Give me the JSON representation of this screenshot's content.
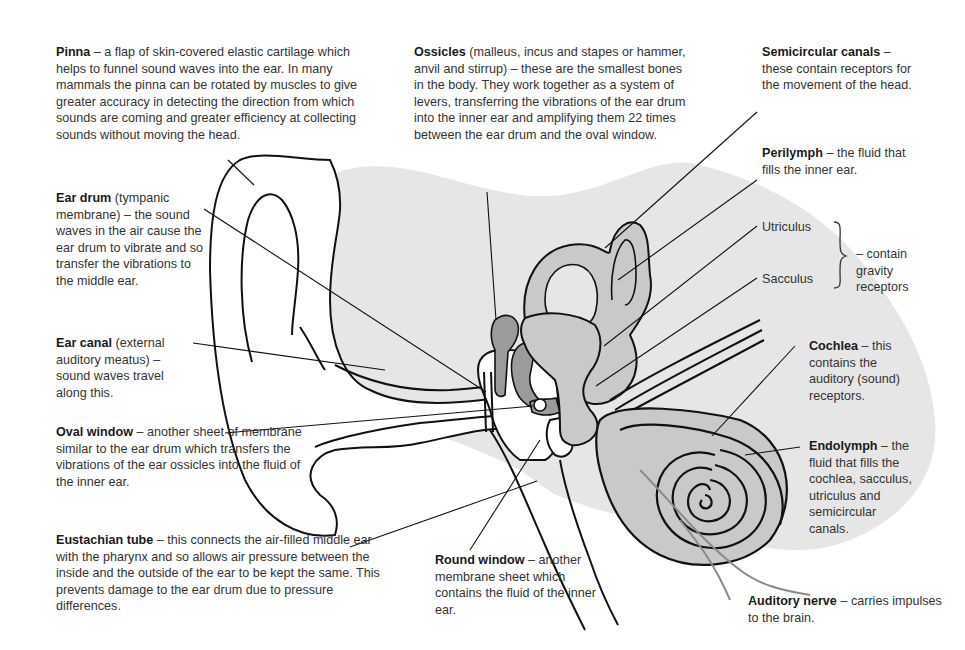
{
  "diagram": {
    "colors": {
      "head_shading": "#e6e6e6",
      "inner_fill": "#c9c9c9",
      "ossicle_fill": "#9b9b9b",
      "line": "#111111",
      "nerve": "#8a8a8a"
    },
    "labels": {
      "pinna": {
        "term": "Pinna",
        "text": "– a flap of skin-covered elastic cartilage which helps to funnel sound waves into the ear. In many mammals the pinna can be rotated by muscles to give greater accuracy in detecting the direction from which sounds are coming and greater efficiency at collecting sounds without moving the head."
      },
      "ear_drum": {
        "term": "Ear drum",
        "text": "(tympanic membrane) – the sound waves in the air cause the ear drum to vibrate and so transfer the vibrations to the middle ear."
      },
      "ear_canal": {
        "term": "Ear canal",
        "text": "(external auditory meatus) – sound waves travel along this."
      },
      "oval_window": {
        "term": "Oval window",
        "text": "– another sheet of membrane similar to the ear drum which transfers the vibrations of the ear ossicles into the fluid of the inner ear."
      },
      "eustachian_tube": {
        "term": "Eustachian tube",
        "text": "– this connects the air-filled middle ear with the pharynx and so allows air pressure between the inside and the outside of the ear to be kept the same. This prevents damage to the ear drum due to pressure differences."
      },
      "ossicles": {
        "term": "Ossicles",
        "text": "(malleus, incus and stapes or hammer, anvil and stirrup) – these are the smallest bones in the body. They work together as a system of levers, transferring the vibrations of the ear drum into the inner ear and amplifying them 22 times between the ear drum and the oval window."
      },
      "round_window": {
        "term": "Round window",
        "text": "– another membrane sheet which contains the fluid of the inner ear."
      },
      "semicircular_canals": {
        "term": "Semicircular canals",
        "text": "– these contain receptors for the movement of the head."
      },
      "perilymph": {
        "term": "Perilymph",
        "text": "– the fluid that fills the inner ear."
      },
      "utriculus": {
        "term": "Utriculus"
      },
      "sacculus": {
        "term": "Sacculus"
      },
      "gravity_note": {
        "text": "– contain gravity receptors"
      },
      "cochlea": {
        "term": "Cochlea",
        "text": "– this contains the auditory (sound) receptors."
      },
      "endolymph": {
        "term": "Endolymph",
        "text": "– the fluid that fills the cochlea, sacculus, utriculus and semicircular canals."
      },
      "auditory_nerve": {
        "term": "Auditory nerve",
        "text": "– carries impulses to the brain."
      }
    }
  }
}
